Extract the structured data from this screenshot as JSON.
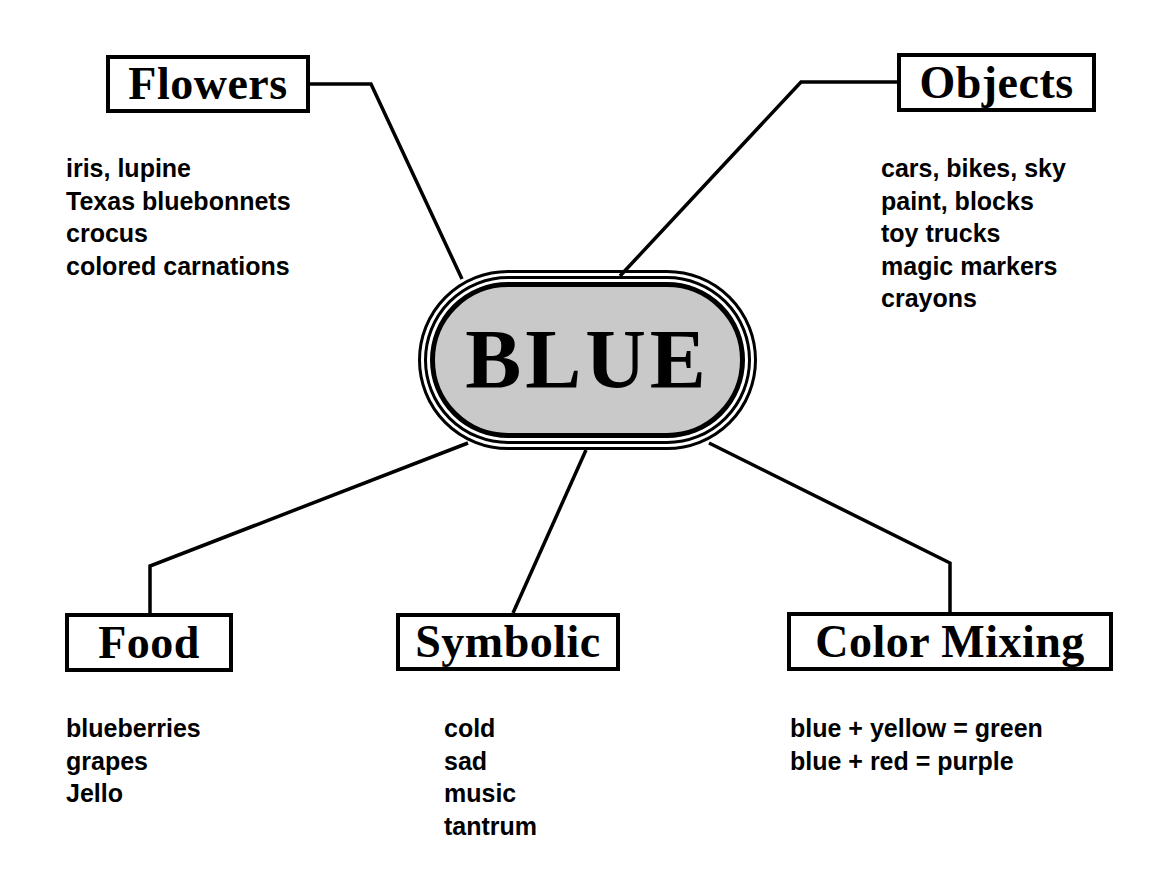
{
  "diagram": {
    "title": "BLUE",
    "center": {
      "label": "BLUE",
      "fill_color": "#c9c9c9",
      "border_color": "#000000"
    },
    "branches": [
      {
        "id": "flowers",
        "label": "Flowers",
        "items": [
          "iris, lupine",
          "Texas bluebonnets",
          "crocus",
          "colored carnations"
        ]
      },
      {
        "id": "objects",
        "label": "Objects",
        "items": [
          "cars, bikes, sky",
          "paint, blocks",
          "toy trucks",
          "magic markers",
          "crayons"
        ]
      },
      {
        "id": "food",
        "label": "Food",
        "items": [
          "blueberries",
          "grapes",
          "Jello"
        ]
      },
      {
        "id": "symbolic",
        "label": "Symbolic",
        "items": [
          "cold",
          "sad",
          "music",
          "tantrum"
        ]
      },
      {
        "id": "color-mixing",
        "label": "Color Mixing",
        "items": [
          "blue + yellow = green",
          "blue + red = purple"
        ]
      }
    ]
  }
}
